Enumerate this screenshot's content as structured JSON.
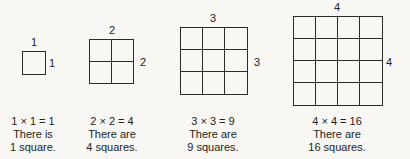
{
  "figures": [
    {
      "n": 1,
      "top_label": "1",
      "side_label": "1",
      "caption": {
        "equation": "1 × 1 = 1",
        "line2": "There is",
        "line3": "1 square."
      },
      "box": {
        "x": 22,
        "y": 51,
        "size": 24
      },
      "top_pos": [
        34,
        42
      ],
      "side_pos": [
        52,
        63
      ],
      "cap_x": 33
    },
    {
      "n": 2,
      "top_label": "2",
      "side_label": "2",
      "caption": {
        "equation": "2 × 2 = 4",
        "line2": "There are",
        "line3": "4 squares."
      },
      "box": {
        "x": 89,
        "y": 39,
        "size": 45
      },
      "top_pos": [
        112,
        30
      ],
      "side_pos": [
        143,
        62
      ],
      "cap_x": 112
    },
    {
      "n": 3,
      "top_label": "3",
      "side_label": "3",
      "caption": {
        "equation": "3 × 3 = 9",
        "line2": "There are",
        "line3": "9 squares."
      },
      "box": {
        "x": 180,
        "y": 27,
        "size": 68
      },
      "top_pos": [
        213,
        18
      ],
      "side_pos": [
        257,
        62
      ],
      "cap_x": 213
    },
    {
      "n": 4,
      "top_label": "4",
      "side_label": "4",
      "caption": {
        "equation": "4 × 4 = 16",
        "line2": "There are",
        "line3": "16 squares."
      },
      "box": {
        "x": 293,
        "y": 16,
        "size": 90
      },
      "top_pos": [
        337,
        7
      ],
      "side_pos": [
        389,
        62
      ],
      "cap_x": 337
    }
  ]
}
